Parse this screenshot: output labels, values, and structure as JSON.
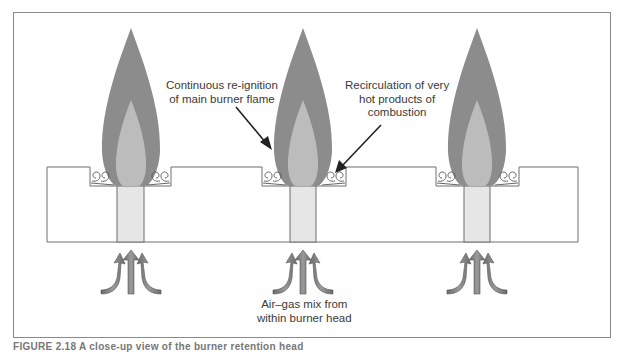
{
  "figure": {
    "labels": {
      "reignition": [
        "Continuous re-ignition",
        "of main burner flame"
      ],
      "recirculation": [
        "Recirculation of very",
        "hot products of",
        "combustion"
      ],
      "airgas": [
        "Air–gas mix from",
        "within burner head"
      ]
    },
    "caption": "FIGURE 2.18  A close-up view of the burner retention head",
    "burners": [
      {
        "name": "burner-1",
        "center_x": 131
      },
      {
        "name": "burner-2",
        "center_x": 303
      },
      {
        "name": "burner-3",
        "center_x": 477
      }
    ],
    "colors": {
      "outer_flame": "#8c8c8c",
      "inner_flame": "#bcbcbc",
      "tube_fill": "#e6e6e6",
      "outline": "#6e6e6e",
      "arrow_fill": "#7d7d7d",
      "leader_line": "#222222"
    }
  }
}
